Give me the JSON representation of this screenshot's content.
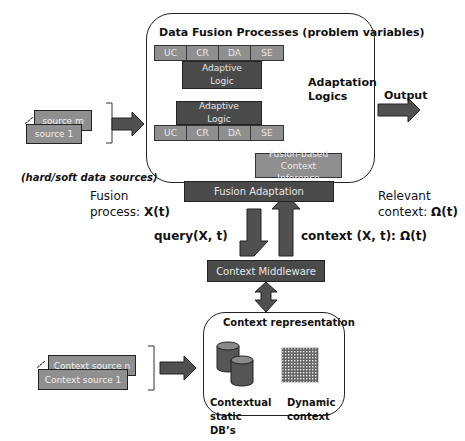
{
  "fusion_box": {
    "title": "Data Fusion Processes (problem variables)",
    "top_row": [
      "UC",
      "CR",
      "DA",
      "SE"
    ],
    "bottom_row": [
      "UC",
      "CR",
      "DA",
      "SE"
    ],
    "adaptive_logic_top": "Adaptive Logic",
    "adaptive_logic_bottom": "Adaptive Logic",
    "adaptation_logics": "Adaptation Logics",
    "inference": "Fusion-based Context Inference"
  },
  "output_label": "Output",
  "fusion_adaptation": "Fusion Adaptation",
  "data_sources": {
    "back": "source m",
    "front": "source 1",
    "caption": "(hard/soft data sources)"
  },
  "fusion_process": {
    "line1": "Fusion",
    "line2": "process: ",
    "value": "X(t)"
  },
  "relevant_context": {
    "line1": "Relevant",
    "line2": "context: ",
    "value": "Ω(t)"
  },
  "query_label": "query(X, t)",
  "context_label": "context (X, t): Ω(t)",
  "context_middleware": "Context Middleware",
  "context_sources": {
    "back": "Context source n",
    "front": "Context source 1"
  },
  "context_representation": {
    "title": "Context representation",
    "static_db": "Contextual static DB’s",
    "dynamic": "Dynamic context"
  },
  "colors": {
    "dark_box": "#4a4a4a",
    "mid_box": "#8f8f8f",
    "arrow": "#505050"
  }
}
